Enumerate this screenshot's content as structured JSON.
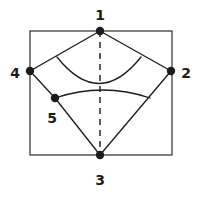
{
  "figure": {
    "canvas": {
      "width": 199,
      "height": 199,
      "background": "#ffffff"
    },
    "stroke_color": "#1b1b1b",
    "label_color": "#1b1b1b",
    "fill_color": "#1b1b1b"
  },
  "frame": {
    "name": "bounding-rectangle",
    "x": 30,
    "y": 31,
    "width": 142,
    "height": 124,
    "stroke_width": 1.1
  },
  "nodes": [
    {
      "id": "1",
      "label": "1",
      "cx": 100,
      "cy": 31,
      "r": 4.2,
      "label_x": 100,
      "label_y": 16,
      "label_anchor": "middle"
    },
    {
      "id": "2",
      "label": "2",
      "cx": 171,
      "cy": 71,
      "r": 4.2,
      "label_x": 186,
      "label_y": 74,
      "label_anchor": "middle"
    },
    {
      "id": "3",
      "label": "3",
      "cx": 100,
      "cy": 155,
      "r": 4.2,
      "label_x": 100,
      "label_y": 181,
      "label_anchor": "middle"
    },
    {
      "id": "4",
      "label": "4",
      "cx": 30,
      "cy": 71,
      "r": 4.2,
      "label_x": 15,
      "label_y": 74,
      "label_anchor": "middle"
    },
    {
      "id": "5",
      "label": "5",
      "cx": 55,
      "cy": 98,
      "r": 4.2,
      "label_x": 52,
      "label_y": 119,
      "label_anchor": "middle"
    }
  ],
  "edges": [
    {
      "name": "edge-1-4",
      "from": "1",
      "to": "4",
      "x1": 100,
      "y1": 31,
      "x2": 30,
      "y2": 71,
      "style": "solid",
      "stroke_width": 1.3
    },
    {
      "name": "edge-1-2",
      "from": "1",
      "to": "2",
      "x1": 100,
      "y1": 31,
      "x2": 171,
      "y2": 71,
      "style": "solid",
      "stroke_width": 1.3
    },
    {
      "name": "edge-4-5",
      "from": "4",
      "to": "5",
      "x1": 30,
      "y1": 71,
      "x2": 55,
      "y2": 98,
      "style": "solid",
      "stroke_width": 1.3
    },
    {
      "name": "edge-5-3",
      "from": "5",
      "to": "3",
      "x1": 55,
      "y1": 98,
      "x2": 100,
      "y2": 155,
      "style": "solid",
      "stroke_width": 1.3
    },
    {
      "name": "edge-2-3",
      "from": "2",
      "to": "3",
      "x1": 171,
      "y1": 71,
      "x2": 100,
      "y2": 155,
      "style": "solid",
      "stroke_width": 1.3
    },
    {
      "name": "edge-1-3-axis",
      "from": "1",
      "to": "3",
      "x1": 100,
      "y1": 31,
      "x2": 100,
      "y2": 155,
      "style": "dashed",
      "stroke_width": 1.4,
      "dash_pattern": "6,5"
    }
  ],
  "arcs": [
    {
      "name": "upper-arc",
      "description": "concave-up arc from edge 1-4 to edge 1-2",
      "path": "M 57 57 Q 99 110 141 57",
      "stroke_width": 1.3
    },
    {
      "name": "lower-arc",
      "description": "convex-up arc from node 5 to edge 2-3",
      "path": "M 55 98 Q 103 82 150 98",
      "stroke_width": 1.3
    }
  ]
}
